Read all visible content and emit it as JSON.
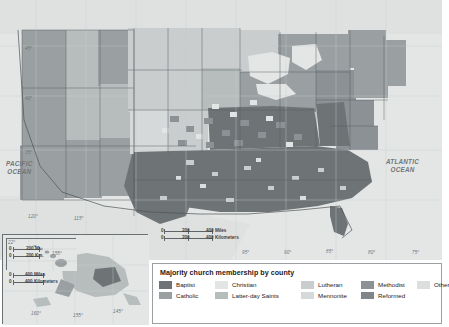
{
  "map": {
    "title": "Majority church membership by county",
    "ocean_labels": [
      {
        "name": "pacific-ocean-label",
        "line1": "PACIFIC",
        "line2": "OCEAN"
      },
      {
        "name": "atlantic-ocean-label",
        "line1": "ATLANTIC",
        "line2": "OCEAN"
      }
    ],
    "latitude_labels": [
      "45°",
      "40°",
      "35°"
    ],
    "longitude_labels": [
      "120°",
      "115°",
      "95°",
      "90°",
      "85°",
      "80°",
      "75°"
    ],
    "inset_longitude_labels": [
      "160°",
      "155°",
      "150°",
      "145°"
    ],
    "inset_latitude_labels": [
      "22°",
      "18°"
    ],
    "scales": {
      "main": {
        "miles": {
          "zero": "0",
          "mid": "200",
          "end": "400 Miles"
        },
        "km": {
          "zero": "0",
          "mid": "200",
          "end": "400 Kilometers"
        }
      },
      "alaska": {
        "miles": {
          "zero": "0",
          "end": "400 Miles"
        },
        "km": {
          "zero": "0",
          "end": "400 Kilometers"
        }
      },
      "hawaii": {
        "miles": {
          "zero": "0",
          "end": "200 Mi."
        },
        "km": {
          "zero": "0",
          "end": "200 Km."
        }
      }
    },
    "colors": {
      "background": "#e9eaea",
      "ocean": "#e4e6e6",
      "border": "#6b7073",
      "text": "#1d2022"
    }
  },
  "legend": {
    "title": "Majority church membership by county",
    "items": [
      {
        "label": "Baptist",
        "color": "#6e7476",
        "row": 1,
        "col": 1
      },
      {
        "label": "Catholic",
        "color": "#9aa0a2",
        "row": 2,
        "col": 1
      },
      {
        "label": "Christian",
        "color": "#e3e5e4",
        "row": 1,
        "col": 2
      },
      {
        "label": "Latter-day Saints",
        "color": "#b7bcbd",
        "row": 2,
        "col": 2
      },
      {
        "label": "Lutheran",
        "color": "#c9cdce",
        "row": 1,
        "col": 3
      },
      {
        "label": "Mennonite",
        "color": "#d6d9d9",
        "row": 2,
        "col": 3
      },
      {
        "label": "Methodist",
        "color": "#8b9194",
        "row": 1,
        "col": 4
      },
      {
        "label": "Reformed",
        "color": "#7f8588",
        "row": 2,
        "col": 4
      },
      {
        "label": "Other",
        "color": "#dcdedd",
        "row": 1,
        "col": 5
      }
    ]
  }
}
